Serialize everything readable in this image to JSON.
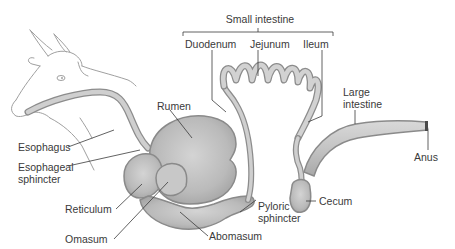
{
  "diagram": {
    "colors": {
      "organ_fill": "#bdbdbd",
      "organ_light": "#d6d6d6",
      "organ_outline": "#8a8a8a",
      "leader_line": "#3a3a3a",
      "cow_outline": "#9a9a9a",
      "text": "#3a3a3a"
    },
    "labels": {
      "small_intestine": "Small intestine",
      "duodenum": "Duodenum",
      "jejunum": "Jejunum",
      "ileum": "Ileum",
      "large_intestine_1": "Large",
      "large_intestine_2": "intestine",
      "rumen": "Rumen",
      "esophagus": "Esophagus",
      "esophageal_sphincter_1": "Esophageal",
      "esophageal_sphincter_2": "sphincter",
      "reticulum": "Reticulum",
      "omasum": "Omasum",
      "abomasum": "Abomasum",
      "pyloric_sphincter_1": "Pyloric",
      "pyloric_sphincter_2": "sphincter",
      "cecum": "Cecum",
      "anus": "Anus"
    }
  }
}
